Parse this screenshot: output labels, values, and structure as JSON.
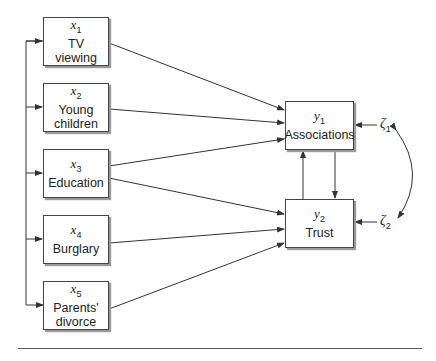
{
  "diagram": {
    "type": "path-diagram",
    "exogenous": [
      {
        "symbol": "x",
        "index": "1",
        "label_line1": "TV",
        "label_line2": "viewing"
      },
      {
        "symbol": "x",
        "index": "2",
        "label_line1": "Young",
        "label_line2": "children"
      },
      {
        "symbol": "x",
        "index": "3",
        "label_line1": "Education",
        "label_line2": ""
      },
      {
        "symbol": "x",
        "index": "4",
        "label_line1": "Burglary",
        "label_line2": ""
      },
      {
        "symbol": "x",
        "index": "5",
        "label_line1": "Parents'",
        "label_line2": "divorce"
      }
    ],
    "endogenous": [
      {
        "symbol": "y",
        "index": "1",
        "label": "Associations"
      },
      {
        "symbol": "y",
        "index": "2",
        "label": "Trust"
      }
    ],
    "disturbances": [
      {
        "symbol": "ζ",
        "index": "1"
      },
      {
        "symbol": "ζ",
        "index": "2"
      }
    ],
    "paths": [
      [
        "x1",
        "y1"
      ],
      [
        "x2",
        "y1"
      ],
      [
        "x3",
        "y1"
      ],
      [
        "x3",
        "y2"
      ],
      [
        "x4",
        "y2"
      ],
      [
        "x5",
        "y2"
      ],
      [
        "y1",
        "y2"
      ],
      [
        "y2",
        "y1"
      ],
      [
        "ζ1",
        "y1"
      ],
      [
        "ζ2",
        "y2"
      ]
    ],
    "correlations": [
      [
        "x1",
        "x2",
        "x3",
        "x4",
        "x5"
      ],
      [
        "ζ1",
        "ζ2"
      ]
    ],
    "colors": {
      "line": "#333333",
      "box_border": "#444444",
      "shadow": "#9a9a9a"
    }
  }
}
